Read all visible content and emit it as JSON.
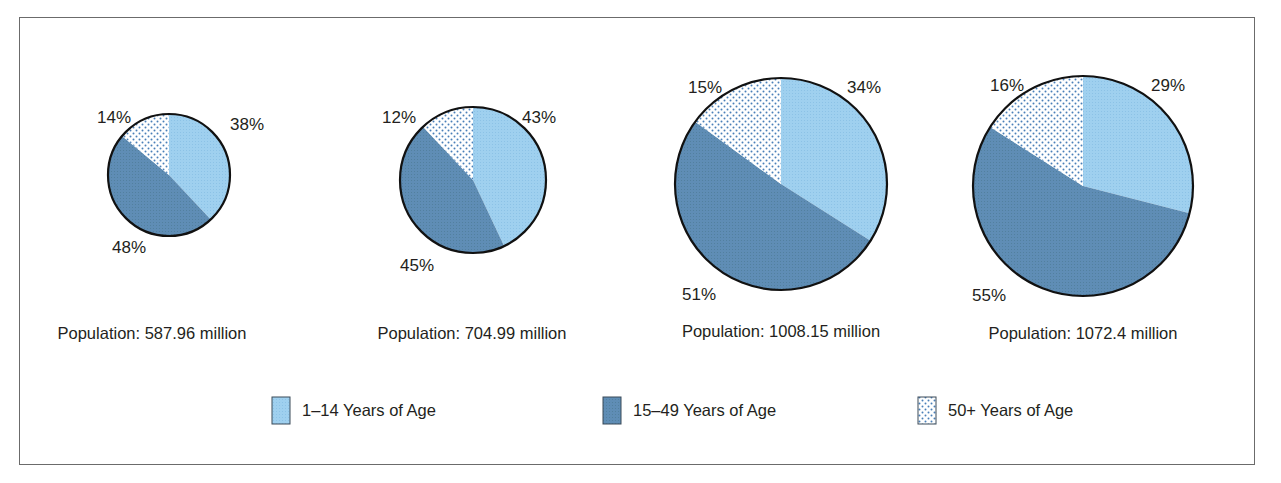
{
  "chart_data": {
    "type": "pie",
    "title": "",
    "legend": {
      "position": "bottom",
      "entries": [
        "1–14 Years of Age",
        "15–49 Years of Age",
        "50+ Years of Age"
      ]
    },
    "colors": {
      "1-14": "#9fd0ef",
      "15-49": "#5f8db5",
      "50+": "#ffffff",
      "dot": "#4a7fb8",
      "outline": "#111111"
    },
    "pies": [
      {
        "population_label": "Population: 587.96 million",
        "population_millions": 587.96,
        "slices": [
          {
            "name": "1–14 Years of Age",
            "value": 38,
            "label": "38%"
          },
          {
            "name": "15–49 Years of Age",
            "value": 48,
            "label": "48%"
          },
          {
            "name": "50+ Years of Age",
            "value": 14,
            "label": "14%"
          }
        ]
      },
      {
        "population_label": "Population: 704.99 million",
        "population_millions": 704.99,
        "slices": [
          {
            "name": "1–14 Years of Age",
            "value": 43,
            "label": "43%"
          },
          {
            "name": "15–49 Years of Age",
            "value": 45,
            "label": "45%"
          },
          {
            "name": "50+ Years of Age",
            "value": 12,
            "label": "12%"
          }
        ]
      },
      {
        "population_label": "Population: 1008.15 million",
        "population_millions": 1008.15,
        "slices": [
          {
            "name": "1–14 Years of Age",
            "value": 34,
            "label": "34%"
          },
          {
            "name": "15–49 Years of Age",
            "value": 51,
            "label": "51%"
          },
          {
            "name": "50+ Years of Age",
            "value": 15,
            "label": "15%"
          }
        ]
      },
      {
        "population_label": "Population: 1072.4 million",
        "population_millions": 1072.4,
        "slices": [
          {
            "name": "1–14 Years of Age",
            "value": 29,
            "label": "29%"
          },
          {
            "name": "15–49 Years of Age",
            "value": 55,
            "label": "55%"
          },
          {
            "name": "50+ Years of Age",
            "value": 16,
            "label": "16%"
          }
        ]
      }
    ]
  }
}
